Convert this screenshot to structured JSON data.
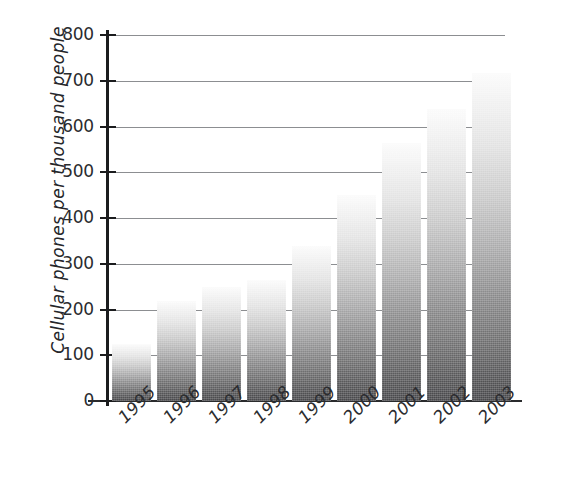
{
  "chart_data": {
    "type": "bar",
    "title": "",
    "subtitle": "",
    "xlabel": "",
    "ylabel": "Cellular phones per thousand people",
    "categories": [
      "1995",
      "1996",
      "1997",
      "1998",
      "1999",
      "2000",
      "2001",
      "2002",
      "2003"
    ],
    "values": [
      125,
      218,
      250,
      265,
      338,
      450,
      565,
      638,
      718
    ],
    "ylim": [
      0,
      800
    ],
    "ytick_labels": [
      "800",
      "700",
      "600",
      "500",
      "400",
      "300",
      "200",
      "100",
      "0"
    ],
    "ytick_values": [
      800,
      700,
      600,
      500,
      400,
      300,
      200,
      100,
      0
    ],
    "grid": "horizontal",
    "legend": "none",
    "bar_fill": "vertical gradient light-gray (top) to dark-gray (bottom)",
    "colors": {
      "bar_top": "#fbfbfb",
      "bar_bottom": "#47474a",
      "axis": "#1b1c1e",
      "gridline": "#8c8e91",
      "text": "#2b2c2f",
      "background": "#ffffff"
    }
  }
}
